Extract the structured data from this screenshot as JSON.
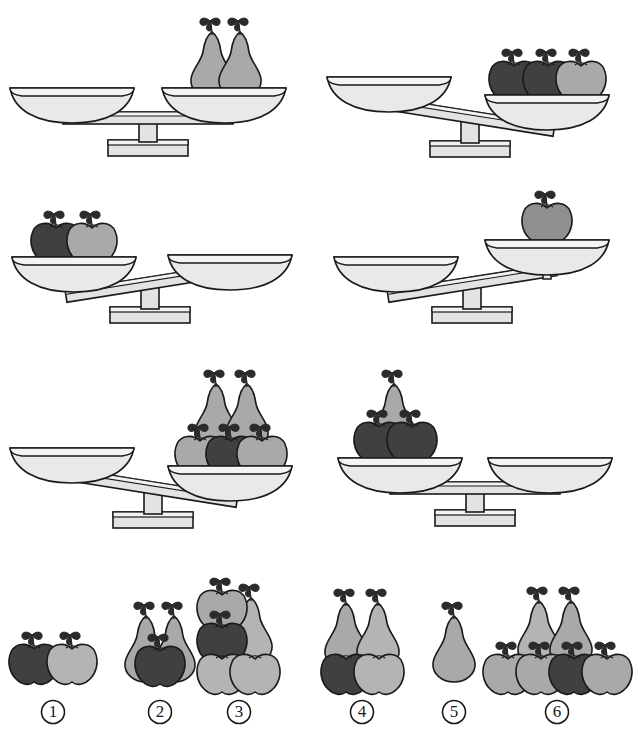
{
  "page": {
    "background_color": "#ffffff",
    "width": 643,
    "height": 751
  },
  "colors": {
    "outline": "#1a1a1a",
    "pan_fill": "#e9e9e9",
    "pan_shade": "#d8d8d8",
    "beam_fill": "#e3e3e3",
    "beam_shade": "#cfcfcf",
    "base_fill": "#e3e3e3",
    "apple_dark": "#404040",
    "apple_light": "#b4b4b4",
    "pear_fill": "#a9a9a9",
    "pear_light": "#bdbdbd",
    "stem_leaf": "#2b2b2b"
  },
  "legend": {
    "fruit_types": [
      "apple",
      "pear"
    ],
    "apple_shades": [
      "dark",
      "light"
    ],
    "pear_shades": [
      "gray",
      "light-gray"
    ]
  },
  "scales": [
    {
      "id": 1,
      "position": "row1-left",
      "state": "balanced",
      "tilt_degrees": 0,
      "left_pan": {
        "items": []
      },
      "right_pan": {
        "items": [
          {
            "fruit": "pear",
            "shade": "gray"
          },
          {
            "fruit": "pear",
            "shade": "gray"
          }
        ]
      }
    },
    {
      "id": 2,
      "position": "row1-right",
      "state": "right-down",
      "tilt_degrees": 9,
      "left_pan": {
        "items": []
      },
      "right_pan": {
        "items": [
          {
            "fruit": "apple",
            "shade": "dark"
          },
          {
            "fruit": "apple",
            "shade": "dark"
          },
          {
            "fruit": "apple",
            "shade": "light"
          }
        ]
      }
    },
    {
      "id": 3,
      "position": "row2-left",
      "state": "left-down",
      "tilt_degrees": -9,
      "left_pan": {
        "items": [
          {
            "fruit": "apple",
            "shade": "dark"
          },
          {
            "fruit": "apple",
            "shade": "light"
          }
        ]
      },
      "right_pan": {
        "items": []
      }
    },
    {
      "id": 4,
      "position": "row2-right",
      "state": "left-down",
      "tilt_degrees": -9,
      "left_pan": {
        "items": []
      },
      "right_pan": {
        "items": [
          {
            "fruit": "apple",
            "shade": "gray"
          }
        ]
      }
    },
    {
      "id": 5,
      "position": "row3-left",
      "state": "right-down",
      "tilt_degrees": 9,
      "left_pan": {
        "items": []
      },
      "right_pan": {
        "items": [
          {
            "fruit": "apple",
            "shade": "light"
          },
          {
            "fruit": "apple",
            "shade": "dark"
          },
          {
            "fruit": "apple",
            "shade": "light"
          },
          {
            "fruit": "pear",
            "shade": "gray"
          },
          {
            "fruit": "pear",
            "shade": "gray"
          }
        ]
      }
    },
    {
      "id": 6,
      "position": "row3-right",
      "state": "balanced",
      "tilt_degrees": 0,
      "left_pan": {
        "items": [
          {
            "fruit": "apple",
            "shade": "dark"
          },
          {
            "fruit": "apple",
            "shade": "dark"
          },
          {
            "fruit": "pear",
            "shade": "gray"
          }
        ]
      },
      "right_pan": {
        "items": []
      }
    }
  ],
  "options": [
    {
      "number": 1,
      "label": "①",
      "items": [
        {
          "fruit": "apple",
          "shade": "dark"
        },
        {
          "fruit": "apple",
          "shade": "light"
        }
      ],
      "counts": {
        "apples": 2,
        "pears": 0
      }
    },
    {
      "number": 2,
      "label": "②",
      "items": [
        {
          "fruit": "pear",
          "shade": "gray"
        },
        {
          "fruit": "pear",
          "shade": "gray"
        },
        {
          "fruit": "apple",
          "shade": "dark"
        }
      ],
      "counts": {
        "apples": 1,
        "pears": 2
      }
    },
    {
      "number": 3,
      "label": "③",
      "items": [
        {
          "fruit": "apple",
          "shade": "light"
        },
        {
          "fruit": "apple",
          "shade": "dark"
        },
        {
          "fruit": "apple",
          "shade": "light"
        },
        {
          "fruit": "apple",
          "shade": "light"
        },
        {
          "fruit": "pear",
          "shade": "light"
        }
      ],
      "counts": {
        "apples": 4,
        "pears": 1
      }
    },
    {
      "number": 4,
      "label": "④",
      "items": [
        {
          "fruit": "pear",
          "shade": "gray"
        },
        {
          "fruit": "pear",
          "shade": "light"
        },
        {
          "fruit": "apple",
          "shade": "dark"
        },
        {
          "fruit": "apple",
          "shade": "light"
        }
      ],
      "counts": {
        "apples": 2,
        "pears": 2
      }
    },
    {
      "number": 5,
      "label": "⑤",
      "items": [
        {
          "fruit": "pear",
          "shade": "gray"
        }
      ],
      "counts": {
        "apples": 0,
        "pears": 1
      }
    },
    {
      "number": 6,
      "label": "⑥",
      "items": [
        {
          "fruit": "pear",
          "shade": "gray"
        },
        {
          "fruit": "pear",
          "shade": "gray"
        },
        {
          "fruit": "apple",
          "shade": "light"
        },
        {
          "fruit": "apple",
          "shade": "light"
        },
        {
          "fruit": "apple",
          "shade": "dark"
        },
        {
          "fruit": "apple",
          "shade": "light"
        }
      ],
      "counts": {
        "apples": 4,
        "pears": 2
      }
    }
  ]
}
